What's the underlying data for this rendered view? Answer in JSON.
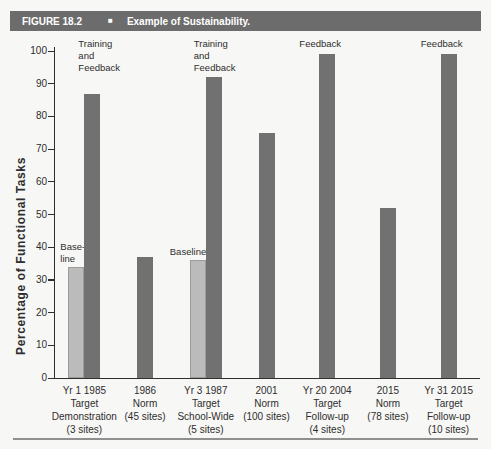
{
  "figure": {
    "label": "FIGURE 18.2",
    "bullet": "■",
    "title": "Example of Sustainability."
  },
  "chart_data": {
    "type": "bar",
    "title": "Example of Sustainability.",
    "xlabel": "",
    "ylabel": "Percentage of Functional Tasks",
    "ylim": [
      0,
      100
    ],
    "yticks": [
      0,
      10,
      20,
      30,
      40,
      50,
      60,
      70,
      80,
      90,
      100
    ],
    "grid": false,
    "legend": "none",
    "series_colors": {
      "baseline": "#bbbbbb",
      "intervention": "#717171"
    },
    "groups": [
      {
        "label_lines": [
          "Yr 1 1985",
          "Target",
          "Demonstration",
          "(3 sites)"
        ],
        "bars": [
          {
            "value": 34,
            "series": "baseline",
            "annotation": {
              "lines": [
                "Base-",
                "line"
              ],
              "position": "bar-top",
              "align": "left",
              "dx": -8
            }
          },
          {
            "value": 87,
            "series": "intervention",
            "annotation": {
              "lines": [
                "Training",
                "and",
                "Feedback"
              ],
              "position": "plot-top",
              "align": "left",
              "dx": -6
            }
          }
        ]
      },
      {
        "label_lines": [
          "1986",
          "Norm",
          "(45 sites)"
        ],
        "bars": [
          {
            "value": 37,
            "series": "intervention"
          }
        ]
      },
      {
        "label_lines": [
          "Yr 3 1987",
          "Target",
          "School-Wide",
          "(5 sites)"
        ],
        "bars": [
          {
            "value": 36,
            "series": "baseline",
            "annotation": {
              "lines": [
                "Baseline"
              ],
              "position": "bar-top",
              "align": "left",
              "dx": -20
            }
          },
          {
            "value": 92,
            "series": "intervention",
            "annotation": {
              "lines": [
                "Training",
                "and",
                "Feedback"
              ],
              "position": "plot-top",
              "align": "left",
              "dx": -12
            }
          }
        ]
      },
      {
        "label_lines": [
          "2001",
          "Norm",
          "(100 sites)"
        ],
        "bars": [
          {
            "value": 75,
            "series": "intervention"
          }
        ]
      },
      {
        "label_lines": [
          "Yr 20 2004",
          "Target",
          "Follow-up",
          "(4 sites)"
        ],
        "bars": [
          {
            "value": 99,
            "series": "intervention",
            "annotation": {
              "lines": [
                "Feedback"
              ],
              "position": "plot-top",
              "align": "center",
              "dx": -7
            }
          }
        ]
      },
      {
        "label_lines": [
          "2015",
          "Norm",
          "(78 sites)"
        ],
        "bars": [
          {
            "value": 52,
            "series": "intervention"
          }
        ]
      },
      {
        "label_lines": [
          "Yr 31 2015",
          "Target",
          "Follow-up",
          "(10 sites)"
        ],
        "bars": [
          {
            "value": 99,
            "series": "intervention",
            "annotation": {
              "lines": [
                "Feedback"
              ],
              "position": "plot-top",
              "align": "center",
              "dx": -7
            }
          }
        ]
      }
    ]
  }
}
